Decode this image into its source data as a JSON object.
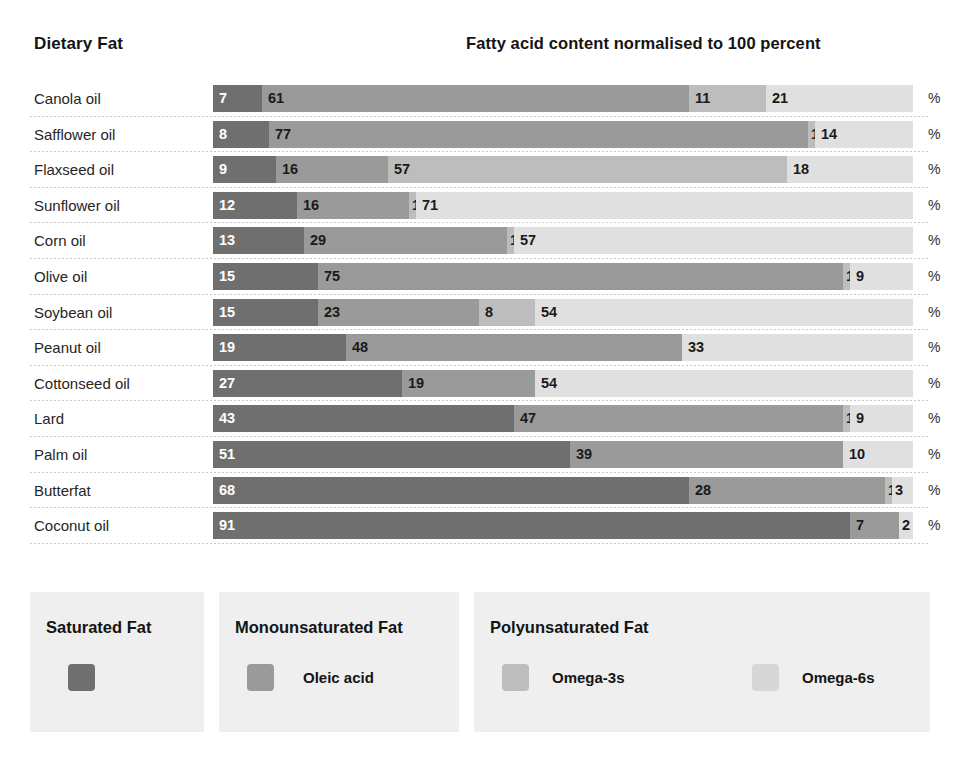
{
  "header": {
    "left_title": "Dietary Fat",
    "right_title": "Fatty acid content normalised to 100 percent"
  },
  "units": {
    "percent_symbol": "%"
  },
  "legend": {
    "saturated": {
      "title": "Saturated Fat",
      "swatch_color": "#6f6f6f"
    },
    "monounsaturated": {
      "title": "Monounsaturated Fat",
      "item_label": "Oleic acid",
      "swatch_color": "#9a9a9a"
    },
    "polyunsaturated": {
      "title": "Polyunsaturated Fat",
      "omega3_label": "Omega-3s",
      "omega6_label": "Omega-6s",
      "omega3_color": "#bdbdbd",
      "omega6_color": "#d7d7d7"
    }
  },
  "chart_data": {
    "type": "bar",
    "orientation": "horizontal",
    "stacked": true,
    "normalized_to": 100,
    "title": "Fatty acid content normalised to 100 percent",
    "xlabel": "%",
    "ylabel": "Dietary Fat",
    "xlim": [
      0,
      100
    ],
    "grid": false,
    "legend_position": "bottom",
    "series": [
      {
        "name": "Saturated Fat",
        "key": "saturated",
        "color": "#6f6f6f"
      },
      {
        "name": "Monounsaturated Fat",
        "key": "monounsaturated",
        "color": "#9a9a9a"
      },
      {
        "name": "Omega-3s",
        "key": "omega3",
        "color": "#bdbdbd"
      },
      {
        "name": "Omega-6s",
        "key": "omega6",
        "color": "#e0e0e0"
      }
    ],
    "categories": [
      "Canola oil",
      "Safflower oil",
      "Flaxseed oil",
      "Sunflower oil",
      "Corn oil",
      "Olive oil",
      "Soybean oil",
      "Peanut oil",
      "Cottonseed oil",
      "Lard",
      "Palm oil",
      "Butterfat",
      "Coconut oil"
    ],
    "rows": [
      {
        "label": "Canola oil",
        "saturated": 7,
        "monounsaturated": 61,
        "omega3": 11,
        "omega6": 21
      },
      {
        "label": "Safflower oil",
        "saturated": 8,
        "monounsaturated": 77,
        "omega3": 1,
        "omega6": 14
      },
      {
        "label": "Flaxseed oil",
        "saturated": 9,
        "monounsaturated": 16,
        "omega3": 57,
        "omega6": 18
      },
      {
        "label": "Sunflower oil",
        "saturated": 12,
        "monounsaturated": 16,
        "omega3": 1,
        "omega6": 71
      },
      {
        "label": "Corn oil",
        "saturated": 13,
        "monounsaturated": 29,
        "omega3": 1,
        "omega6": 57
      },
      {
        "label": "Olive oil",
        "saturated": 15,
        "monounsaturated": 75,
        "omega3": 1,
        "omega6": 9
      },
      {
        "label": "Soybean oil",
        "saturated": 15,
        "monounsaturated": 23,
        "omega3": 8,
        "omega6": 54
      },
      {
        "label": "Peanut oil",
        "saturated": 19,
        "monounsaturated": 48,
        "omega3": 0,
        "omega6": 33
      },
      {
        "label": "Cottonseed oil",
        "saturated": 27,
        "monounsaturated": 19,
        "omega3": 0,
        "omega6": 54
      },
      {
        "label": "Lard",
        "saturated": 43,
        "monounsaturated": 47,
        "omega3": 1,
        "omega6": 9
      },
      {
        "label": "Palm oil",
        "saturated": 51,
        "monounsaturated": 39,
        "omega3": 0,
        "omega6": 10
      },
      {
        "label": "Butterfat",
        "saturated": 68,
        "monounsaturated": 28,
        "omega3": 1,
        "omega6": 3
      },
      {
        "label": "Coconut oil",
        "saturated": 91,
        "monounsaturated": 7,
        "omega3": 0,
        "omega6": 2
      }
    ]
  }
}
